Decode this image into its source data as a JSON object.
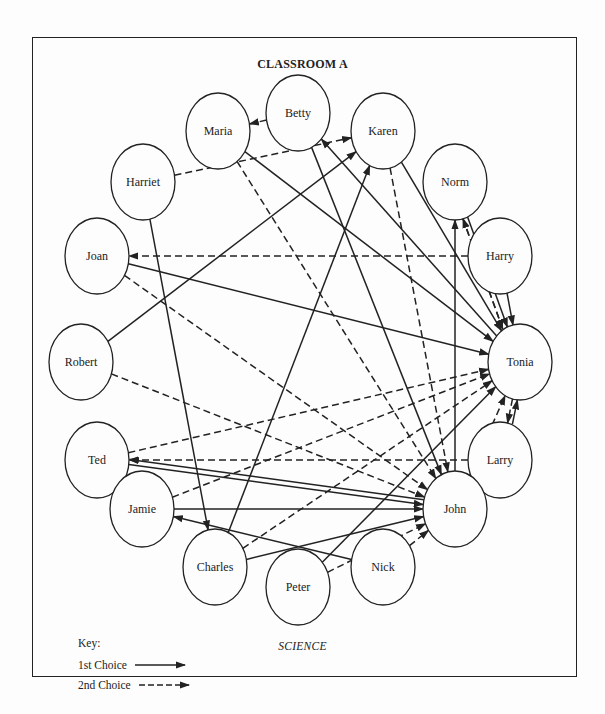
{
  "title": "CLASSROOM A",
  "caption": "SCIENCE",
  "key": {
    "title": "Key:",
    "first_choice": "1st Choice",
    "second_choice": "2nd Choice"
  },
  "colors": {
    "ink": "#222222",
    "background": "#fdfdfd"
  },
  "nodes": [
    {
      "id": "betty",
      "label": "Betty",
      "x": 298,
      "y": 113
    },
    {
      "id": "maria",
      "label": "Maria",
      "x": 218,
      "y": 131
    },
    {
      "id": "karen",
      "label": "Karen",
      "x": 383,
      "y": 131
    },
    {
      "id": "harriet",
      "label": "Harriet",
      "x": 143,
      "y": 182
    },
    {
      "id": "norm",
      "label": "Norm",
      "x": 455,
      "y": 182
    },
    {
      "id": "joan",
      "label": "Joan",
      "x": 97,
      "y": 256
    },
    {
      "id": "harry",
      "label": "Harry",
      "x": 500,
      "y": 256
    },
    {
      "id": "robert",
      "label": "Robert",
      "x": 81,
      "y": 362
    },
    {
      "id": "tonia",
      "label": "Tonia",
      "x": 520,
      "y": 362
    },
    {
      "id": "ted",
      "label": "Ted",
      "x": 97,
      "y": 460
    },
    {
      "id": "larry",
      "label": "Larry",
      "x": 500,
      "y": 460
    },
    {
      "id": "jamie",
      "label": "Jamie",
      "x": 142,
      "y": 509
    },
    {
      "id": "john",
      "label": "John",
      "x": 455,
      "y": 509
    },
    {
      "id": "charles",
      "label": "Charles",
      "x": 215,
      "y": 567
    },
    {
      "id": "peter",
      "label": "Peter",
      "x": 298,
      "y": 587
    },
    {
      "id": "nick",
      "label": "Nick",
      "x": 383,
      "y": 567
    }
  ],
  "edges": [
    {
      "from": "betty",
      "to": "maria",
      "choice": 2
    },
    {
      "from": "harriet",
      "to": "karen",
      "choice": 2
    },
    {
      "from": "robert",
      "to": "karen",
      "choice": 1
    },
    {
      "from": "harry",
      "to": "joan",
      "choice": 2
    },
    {
      "from": "larry",
      "to": "ted",
      "choice": 2
    },
    {
      "from": "joan",
      "to": "tonia",
      "choice": 1
    },
    {
      "from": "joan",
      "to": "john",
      "choice": 2
    },
    {
      "from": "robert",
      "to": "john",
      "choice": 2
    },
    {
      "from": "maria",
      "to": "tonia",
      "choice": 1
    },
    {
      "from": "maria",
      "to": "john",
      "choice": 2
    },
    {
      "from": "betty",
      "to": "john",
      "choice": 1
    },
    {
      "from": "tonia",
      "to": "betty",
      "choice": 1
    },
    {
      "from": "karen",
      "to": "john",
      "choice": 2
    },
    {
      "from": "charles",
      "to": "karen",
      "choice": 1
    },
    {
      "from": "harriet",
      "to": "charles",
      "choice": 1
    },
    {
      "from": "norm",
      "to": "tonia",
      "choice": 1
    },
    {
      "from": "norm",
      "to": "tonia",
      "choice": 2
    },
    {
      "from": "tonia",
      "to": "norm",
      "choice": 2
    },
    {
      "from": "john",
      "to": "norm",
      "choice": 1
    },
    {
      "from": "harry",
      "to": "tonia",
      "choice": 1
    },
    {
      "from": "ted",
      "to": "tonia",
      "choice": 2
    },
    {
      "from": "jamie",
      "to": "tonia",
      "choice": 2
    },
    {
      "from": "charles",
      "to": "tonia",
      "choice": 2
    },
    {
      "from": "peter",
      "to": "tonia",
      "choice": 1
    },
    {
      "from": "ted",
      "to": "john",
      "choice": 1
    },
    {
      "from": "john",
      "to": "ted",
      "choice": 1
    },
    {
      "from": "jamie",
      "to": "john",
      "choice": 1
    },
    {
      "from": "nick",
      "to": "jamie",
      "choice": 1
    },
    {
      "from": "charles",
      "to": "john",
      "choice": 1
    },
    {
      "from": "peter",
      "to": "john",
      "choice": 2
    },
    {
      "from": "nick",
      "to": "john",
      "choice": 2
    },
    {
      "from": "tonia",
      "to": "larry",
      "choice": 2
    },
    {
      "from": "larry",
      "to": "tonia",
      "choice": 1
    },
    {
      "from": "john",
      "to": "tonia",
      "choice": 2
    },
    {
      "from": "karen",
      "to": "tonia",
      "choice": 1
    }
  ]
}
